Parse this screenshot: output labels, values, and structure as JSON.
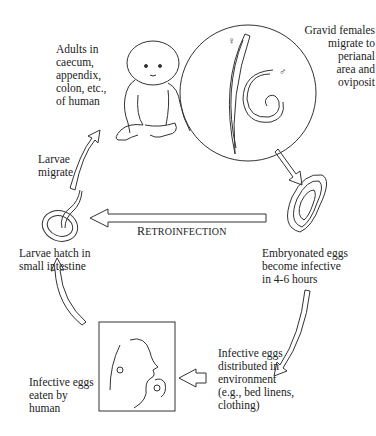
{
  "diagram": {
    "stages": [
      {
        "id": "adults",
        "label": "Adults in\ncaecum,\nappendix,\ncolon, etc.,\nof human"
      },
      {
        "id": "gravid",
        "label": "Gravid females\nmigrate to\nperianal\narea and\noviposit"
      },
      {
        "id": "embryonated",
        "label": "Embryonated eggs\nbecome infective\nin 4-6 hours"
      },
      {
        "id": "environment",
        "label": "Infective eggs\ndistributed in\nenvironment\n(e.g., bed linens,\nclothing)"
      },
      {
        "id": "eaten",
        "label": "Infective eggs\neaten by\nhuman"
      },
      {
        "id": "hatch",
        "label": "Larvae hatch in\nsmall intestine"
      },
      {
        "id": "migrate",
        "label": "Larvae\nmigrate"
      }
    ],
    "retroinfection": {
      "first": "R",
      "rest": "ETROINFECTION"
    },
    "symbols": {
      "female": "♀",
      "male": "♂"
    },
    "colors": {
      "line": "#333333",
      "text": "#222222",
      "background": "#ffffff"
    }
  }
}
